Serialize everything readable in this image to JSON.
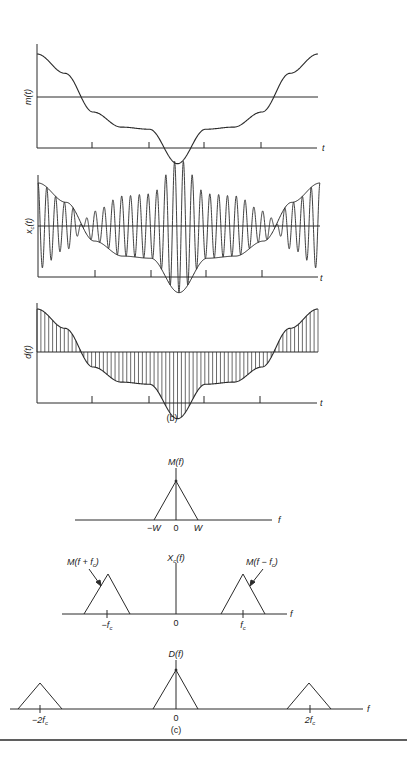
{
  "figure": {
    "part_b": {
      "caption": "(b)",
      "plots": [
        {
          "id": "m",
          "ylabel": "m(t)",
          "xlabel": "t"
        },
        {
          "id": "xc",
          "ylabel": "x_c(t)",
          "ylabel_main": "x",
          "ylabel_sub": "c",
          "ylabel_rest": "(t)",
          "xlabel": "t"
        },
        {
          "id": "d",
          "ylabel": "d(t)",
          "xlabel": "t"
        }
      ]
    },
    "part_c": {
      "caption": "(c)",
      "M": {
        "title": "M(f)",
        "ticks": [
          "−W",
          "0",
          "W"
        ],
        "xlabel": "f"
      },
      "Xc": {
        "title_main": "X",
        "title_sub": "c",
        "title_rest": "(f)",
        "annotation_left": "M(f + f",
        "annotation_left_sub": "c",
        "annotation_left_end": ")",
        "annotation_right": "M(f − f",
        "annotation_right_sub": "c",
        "annotation_right_end": ")",
        "tick_left": "−f",
        "tick_left_sub": "c",
        "tick_zero": "0",
        "tick_right": "f",
        "tick_right_sub": "c",
        "xlabel": "f"
      },
      "D": {
        "title": "D(f)",
        "tick_left": "−2f",
        "tick_left_sub": "c",
        "tick_zero": "0",
        "tick_right": "2f",
        "tick_right_sub": "c",
        "xlabel": "f"
      }
    }
  },
  "chart_data": [
    {
      "type": "line",
      "title": "m(t)",
      "xlabel": "t",
      "ylabel": "m(t)",
      "description": "Message signal: high at ends, negative plateau in middle with dip at center",
      "x": [
        0,
        0.1,
        0.2,
        0.3,
        0.4,
        0.5,
        0.6,
        0.7,
        0.8,
        0.9,
        1.0
      ],
      "values": [
        1.0,
        0.55,
        -0.35,
        -0.7,
        -0.75,
        -1.55,
        -0.75,
        -0.7,
        -0.35,
        0.55,
        1.0
      ],
      "ticks_x": 4
    },
    {
      "type": "line",
      "title": "x_c(t)",
      "xlabel": "t",
      "ylabel": "x_c(t)",
      "description": "DSB-SC modulated carrier m(t)cos(2πf_c t) with envelope ±m(t)",
      "carrier_cycles": 32
    },
    {
      "type": "line",
      "title": "d(t)",
      "xlabel": "t",
      "ylabel": "d(t)",
      "description": "Demodulator product x_c(t)cos(2πf_c t): rectified-like waveform between 0 and m(t)"
    },
    {
      "type": "line",
      "title": "M(f)",
      "description": "Triangular baseband spectrum from −W to W",
      "x": [
        -1,
        0,
        1
      ],
      "values": [
        0,
        1,
        0
      ],
      "xticks": [
        "−W",
        "0",
        "W"
      ]
    },
    {
      "type": "line",
      "title": "X_c(f)",
      "description": "Spectrum shifted to ±f_c, half amplitude",
      "components": [
        {
          "center": "−f_c",
          "label": "M(f + f_c)",
          "height": 0.5
        },
        {
          "center": "f_c",
          "label": "M(f − f_c)",
          "height": 0.5
        }
      ]
    },
    {
      "type": "line",
      "title": "D(f)",
      "description": "Baseband component at 0 plus components at ±2f_c",
      "components": [
        {
          "center": "−2f_c",
          "height": 0.25
        },
        {
          "center": "0",
          "height": 0.5
        },
        {
          "center": "2f_c",
          "height": 0.25
        }
      ]
    }
  ]
}
